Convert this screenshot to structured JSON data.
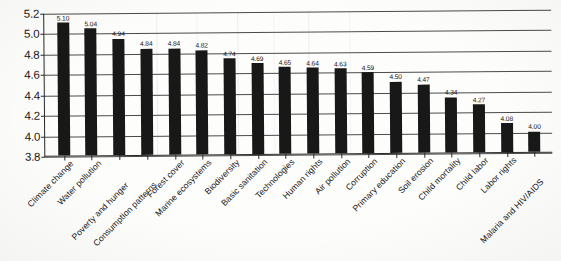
{
  "chart_data": {
    "type": "bar",
    "title": "",
    "subtitle": "",
    "xlabel": "",
    "ylabel": "",
    "ylim": [
      3.8,
      5.2
    ],
    "ytick_step": 0.2,
    "yticks": [
      "5.2",
      "5.0",
      "4.8",
      "4.6",
      "4.4",
      "4.2",
      "4.0",
      "3.8"
    ],
    "grid": true,
    "legend": "none",
    "orientation": "vertical",
    "bar_color": "#181818",
    "categories": [
      "Climate change",
      "Water pollution",
      "Poverty and hunger",
      "Consumption patterns",
      "Forest cover",
      "Marine ecosystems",
      "Biodiversity",
      "Basic sanitation",
      "Technologies",
      "Human rights",
      "Air pollution",
      "Corruption",
      "Primary education",
      "Soil erosion",
      "Child mortality",
      "Child labor",
      "Labor rights",
      "Malaria and HIV/AIDS"
    ],
    "values": [
      5.1,
      5.04,
      4.94,
      4.84,
      4.84,
      4.82,
      4.74,
      4.69,
      4.65,
      4.64,
      4.63,
      4.59,
      4.5,
      4.47,
      4.34,
      4.27,
      4.08,
      4.0
    ],
    "value_labels": [
      "5.10",
      "5.04",
      "4.94",
      "4.84",
      "4.84",
      "4.82",
      "4.74",
      "4.69",
      "4.65",
      "4.64",
      "4.63",
      "4.59",
      "4.50",
      "4.47",
      "4.34",
      "4.27",
      "4.08",
      "4.00"
    ]
  }
}
